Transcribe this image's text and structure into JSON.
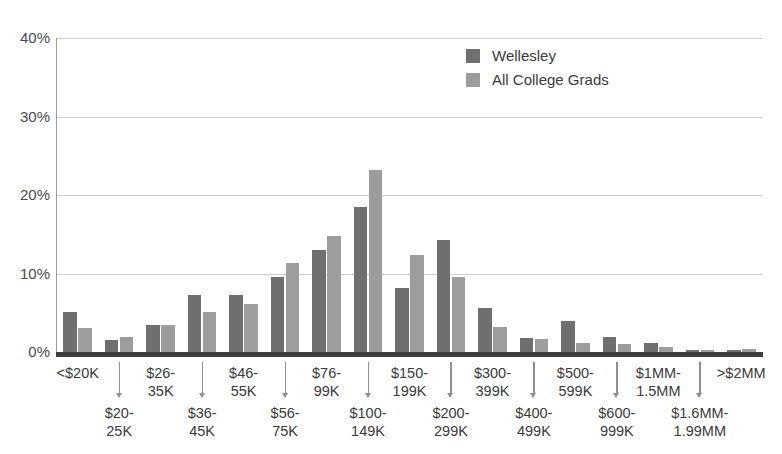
{
  "chart_data": {
    "type": "bar",
    "title": "",
    "xlabel": "",
    "ylabel": "",
    "ylim": [
      0,
      40
    ],
    "y_ticks": [
      "0%",
      "10%",
      "20%",
      "30%",
      "40%"
    ],
    "y_tick_values": [
      0,
      10,
      20,
      30,
      40
    ],
    "grid": true,
    "legend_position": "top-right",
    "categories": [
      "<$20K",
      "$20-25K",
      "$26-35K",
      "$36-45K",
      "$46-55K",
      "$56-75K",
      "$76-99K",
      "$100-149K",
      "$150-199K",
      "$200-299K",
      "$300-399K",
      "$400-499K",
      "$500-599K",
      "$600-999K",
      "$1MM-1.5MM",
      "$1.6MM-1.99MM",
      ">$2MM"
    ],
    "category_lines": [
      [
        "<$20K",
        ""
      ],
      [
        "$20-",
        "25K"
      ],
      [
        "$26-",
        "35K"
      ],
      [
        "$36-",
        "45K"
      ],
      [
        "$46-",
        "55K"
      ],
      [
        "$56-",
        "75K"
      ],
      [
        "$76-",
        "99K"
      ],
      [
        "$100-",
        "149K"
      ],
      [
        "$150-",
        "199K"
      ],
      [
        "$200-",
        "299K"
      ],
      [
        "$300-",
        "399K"
      ],
      [
        "$400-",
        "499K"
      ],
      [
        "$500-",
        "599K"
      ],
      [
        "$600-",
        "999K"
      ],
      [
        "$1MM-",
        "1.5MM"
      ],
      [
        "$1.6MM-",
        "1.99MM"
      ],
      [
        ">$2MM",
        ""
      ]
    ],
    "category_row": [
      0,
      1,
      0,
      1,
      0,
      1,
      0,
      1,
      0,
      1,
      0,
      1,
      0,
      1,
      0,
      1,
      0
    ],
    "series": [
      {
        "name": "Wellesley",
        "color": "#6f6f6f",
        "values": [
          5.1,
          1.5,
          3.5,
          7.3,
          7.2,
          9.6,
          13.0,
          18.5,
          8.1,
          14.3,
          5.6,
          1.8,
          3.9,
          1.9,
          1.1,
          0.3,
          0.3
        ]
      },
      {
        "name": "All College Grads",
        "color": "#9d9d9d",
        "values": [
          3.0,
          1.9,
          3.5,
          5.1,
          6.1,
          11.3,
          14.8,
          23.2,
          12.4,
          9.5,
          3.2,
          1.7,
          1.1,
          1.0,
          0.6,
          0.3,
          0.4
        ]
      }
    ]
  },
  "legend": {
    "items": [
      {
        "label": "Wellesley",
        "color": "#6f6f6f"
      },
      {
        "label": "All College Grads",
        "color": "#9d9d9d"
      }
    ]
  }
}
